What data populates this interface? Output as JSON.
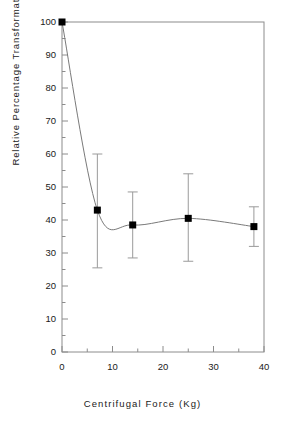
{
  "chart_data": {
    "type": "line",
    "title": "",
    "xlabel": "Centrifugal Force (Kg)",
    "ylabel": "Relative Percentage Transformation",
    "xlim": [
      0,
      40
    ],
    "ylim": [
      0,
      100
    ],
    "x_major_ticks": [
      0,
      10,
      20,
      30,
      40
    ],
    "x_minor_ticks": [
      5,
      15,
      25,
      35
    ],
    "y_major_ticks": [
      0,
      10,
      20,
      30,
      40,
      50,
      60,
      70,
      80,
      90,
      100
    ],
    "y_minor_ticks": [
      5,
      15,
      25,
      35,
      45,
      55,
      65,
      75,
      85,
      95
    ],
    "x_tick_labels": [
      "0",
      "10",
      "20",
      "30",
      "40"
    ],
    "y_tick_labels": [
      "0",
      "10",
      "20",
      "30",
      "40",
      "50",
      "60",
      "70",
      "80",
      "90",
      "100"
    ],
    "grid": false,
    "legend": false,
    "marker": "filled-square",
    "marker_color": "#000000",
    "line_color": "#7a7a7a",
    "errorbar_color": "#9a9a9a",
    "axis_color": "#8c8c8c",
    "background": "#ffffff",
    "x": [
      0,
      7,
      14,
      25,
      38
    ],
    "values": [
      100,
      43,
      38.5,
      40.5,
      38
    ],
    "error_low": [
      100,
      25.5,
      28.5,
      27.5,
      32
    ],
    "error_high": [
      100,
      60,
      48.5,
      54,
      44
    ],
    "series": [
      {
        "name": "Relative Percentage Transformation",
        "points": [
          {
            "x": 0,
            "y": 100,
            "err_low": 100,
            "err_high": 100
          },
          {
            "x": 7,
            "y": 43,
            "err_low": 25.5,
            "err_high": 60
          },
          {
            "x": 14,
            "y": 38.5,
            "err_low": 28.5,
            "err_high": 48.5
          },
          {
            "x": 25,
            "y": 40.5,
            "err_low": 27.5,
            "err_high": 54
          },
          {
            "x": 38,
            "y": 38,
            "err_low": 32,
            "err_high": 44
          }
        ]
      }
    ]
  }
}
